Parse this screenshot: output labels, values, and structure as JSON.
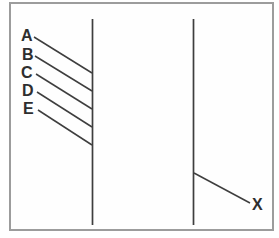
{
  "diagram": {
    "type": "matching-leader-line-diagram",
    "colors": {
      "background": "#ffffff",
      "panel": "#fefefe",
      "frame_border": "#9c9c9c",
      "line": "#3e3e3e",
      "label": "#2e2e2e"
    },
    "frame": {
      "x": 9,
      "y": 2,
      "width": 265,
      "height": 229
    },
    "columns": [
      {
        "name": "left-column",
        "x": 92.5,
        "y1": 19,
        "y2": 225
      },
      {
        "name": "right-column",
        "x": 193.5,
        "y1": 19,
        "y2": 225
      }
    ],
    "left_labels": [
      {
        "text": "A",
        "x": 21,
        "y": 28,
        "line": {
          "x1": 34,
          "y1": 37,
          "x2": 92,
          "y2": 73
        }
      },
      {
        "text": "B",
        "x": 22,
        "y": 47,
        "line": {
          "x1": 35,
          "y1": 56,
          "x2": 92,
          "y2": 91
        }
      },
      {
        "text": "C",
        "x": 21,
        "y": 65,
        "line": {
          "x1": 36,
          "y1": 74,
          "x2": 92,
          "y2": 109
        }
      },
      {
        "text": "D",
        "x": 22,
        "y": 83,
        "line": {
          "x1": 37,
          "y1": 92,
          "x2": 92,
          "y2": 127
        }
      },
      {
        "text": "E",
        "x": 23,
        "y": 101,
        "line": {
          "x1": 38,
          "y1": 110,
          "x2": 92,
          "y2": 145
        }
      }
    ],
    "right_label": {
      "text": "X",
      "x": 252,
      "y": 197,
      "line": {
        "x1": 194,
        "y1": 173,
        "x2": 250,
        "y2": 203
      }
    }
  }
}
